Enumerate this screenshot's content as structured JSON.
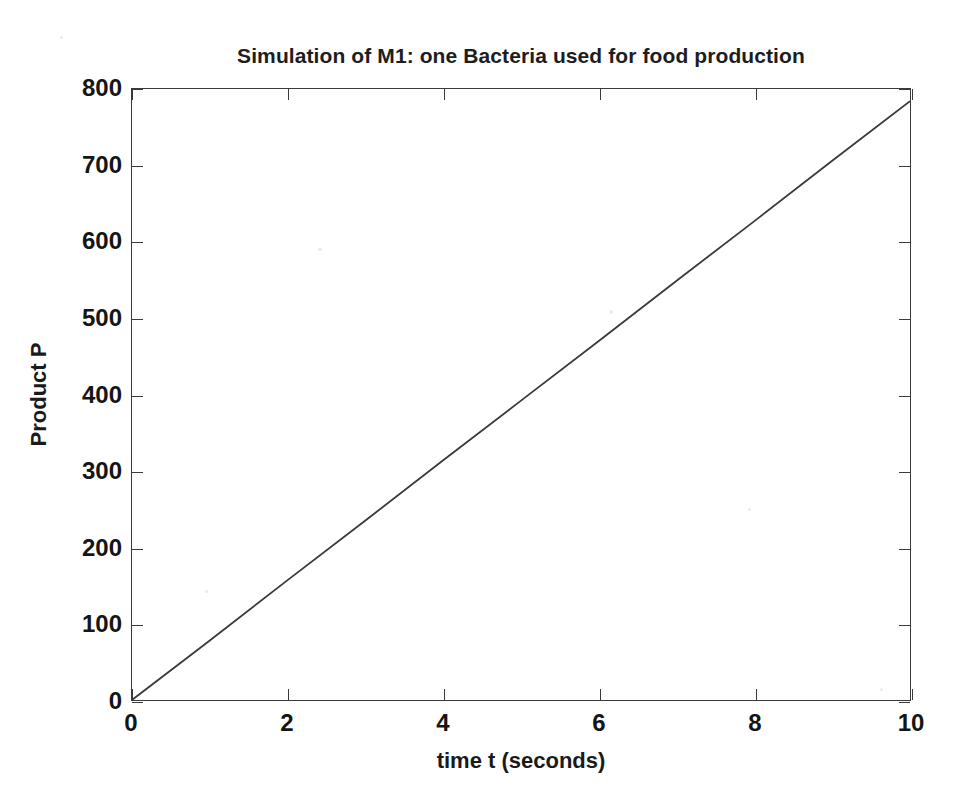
{
  "chart_data": {
    "type": "line",
    "title": "Simulation of M1: one Bacteria used for food production",
    "xlabel": "time t (seconds)",
    "ylabel": "Product P",
    "xlim": [
      0,
      10
    ],
    "ylim": [
      0,
      800
    ],
    "xticks": [
      0,
      2,
      4,
      6,
      8,
      10
    ],
    "yticks": [
      0,
      100,
      200,
      300,
      400,
      500,
      600,
      700,
      800
    ],
    "xtick_labels": [
      "0",
      "2",
      "4",
      "6",
      "8",
      "10"
    ],
    "ytick_labels": [
      "0",
      "100",
      "200",
      "300",
      "400",
      "500",
      "600",
      "700",
      "800"
    ],
    "grid": false,
    "legend": null,
    "line_color": "#3a3a3a",
    "series": [
      {
        "name": "Product P",
        "x": [
          0,
          1,
          2,
          3,
          4,
          5,
          6,
          7,
          8,
          9,
          10
        ],
        "values": [
          0,
          78,
          157,
          235,
          314,
          392,
          470,
          549,
          627,
          706,
          784
        ]
      }
    ],
    "annotations": []
  },
  "axes": {
    "title": "Simulation of M1: one Bacteria used for food production",
    "x_axis_title": "time t (seconds)",
    "y_axis_title": "Product P"
  }
}
